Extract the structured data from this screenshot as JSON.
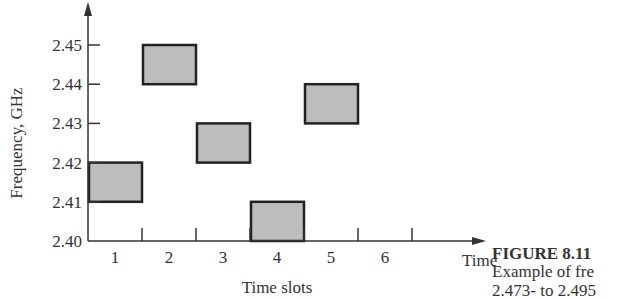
{
  "chart_data": {
    "type": "frequency-hopping-diagram",
    "title": "",
    "xlabel": "Time slots",
    "x_arrow_label": "Time",
    "ylabel": "Frequency, GHz",
    "x_tick_labels": [
      "1",
      "2",
      "3",
      "4",
      "5",
      "6"
    ],
    "y_tick_labels": [
      "2.40",
      "2.41",
      "2.42",
      "2.43",
      "2.44",
      "2.45"
    ],
    "y_ticks": [
      2.4,
      2.41,
      2.42,
      2.43,
      2.44,
      2.45
    ],
    "ylim": [
      2.4,
      2.46
    ],
    "xlim": [
      0.5,
      7.3
    ],
    "grid": false,
    "legend": "none",
    "hops": [
      {
        "slot": 1,
        "freq_low": 2.41,
        "freq_high": 2.42
      },
      {
        "slot": 2,
        "freq_low": 2.44,
        "freq_high": 2.45
      },
      {
        "slot": 3,
        "freq_low": 2.42,
        "freq_high": 2.43
      },
      {
        "slot": 4,
        "freq_low": 2.4,
        "freq_high": 2.41
      },
      {
        "slot": 5,
        "freq_low": 2.43,
        "freq_high": 2.44
      }
    ],
    "colors": {
      "box_fill": "#bdbdbd",
      "box_border": "#222222",
      "axis": "#333333"
    }
  },
  "caption": {
    "title": "FIGURE 8.11",
    "line1": "Example of fre",
    "line2": "2.473- to 2.495"
  }
}
